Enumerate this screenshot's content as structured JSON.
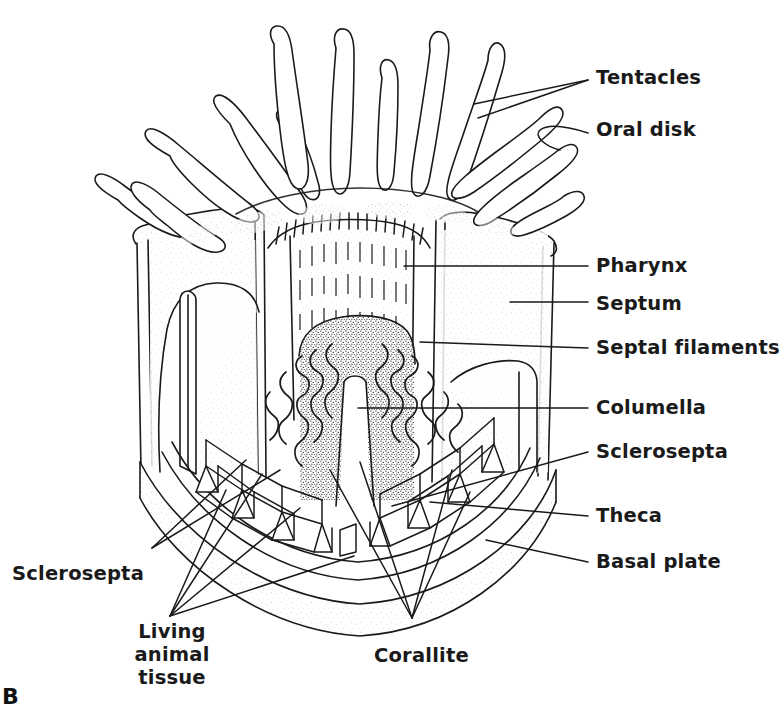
{
  "figure": {
    "id": "B",
    "background_color": "#ffffff",
    "ink_color": "#1a1a1a"
  },
  "labels": {
    "tentacles": "Tentacles",
    "oral_disk": "Oral disk",
    "pharynx": "Pharynx",
    "septum": "Septum",
    "septal_filaments": "Septal filaments",
    "columella": "Columella",
    "sclerosepta_right": "Sclerosepta",
    "theca": "Theca",
    "basal_plate": "Basal plate",
    "sclerosepta_left": "Sclerosepta",
    "living_animal_tissue": "Living animal\ntissue",
    "corallite": "Corallite"
  }
}
